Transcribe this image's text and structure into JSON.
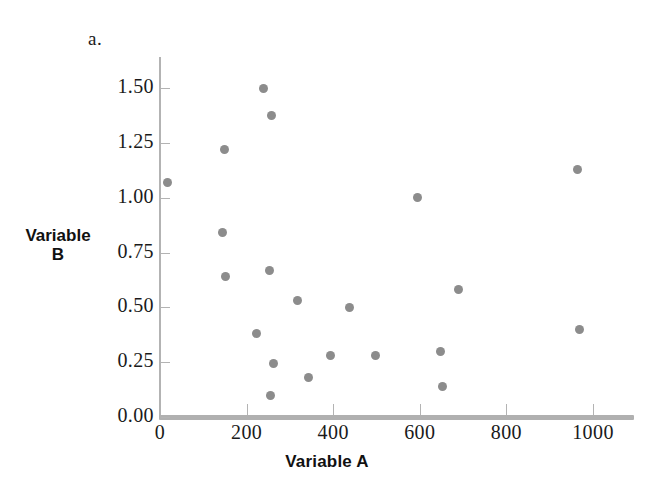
{
  "figure": {
    "panel_label": "a.",
    "marker_color": "#8c8c8c",
    "axis_color": "#b3b3b3",
    "background": "#ffffff"
  },
  "chart_data": {
    "type": "scatter",
    "title": "",
    "panel_label": "a.",
    "xlabel": "Variable A",
    "ylabel_lines": [
      "Variable",
      "B"
    ],
    "ylabel": "Variable B",
    "xlim": [
      0,
      1095
    ],
    "ylim": [
      0.0,
      1.575
    ],
    "xticks": [
      0,
      200,
      400,
      600,
      800,
      1000
    ],
    "xtick_labels": [
      "0",
      "200",
      "400",
      "600",
      "800",
      "1000"
    ],
    "yticks": [
      0.0,
      0.25,
      0.5,
      0.75,
      1.0,
      1.25,
      1.5
    ],
    "ytick_labels": [
      "0.00",
      "0.25",
      "0.50",
      "0.75",
      "1.00",
      "1.25",
      "1.50"
    ],
    "grid": false,
    "legend": false,
    "series": [
      {
        "name": "observations",
        "color": "#8c8c8c",
        "marker": "circle",
        "points": [
          {
            "x": 18,
            "y": 1.07
          },
          {
            "x": 150,
            "y": 1.22
          },
          {
            "x": 145,
            "y": 0.84
          },
          {
            "x": 152,
            "y": 0.64
          },
          {
            "x": 240,
            "y": 1.5
          },
          {
            "x": 257,
            "y": 1.375
          },
          {
            "x": 252,
            "y": 0.67
          },
          {
            "x": 222,
            "y": 0.38
          },
          {
            "x": 262,
            "y": 0.245
          },
          {
            "x": 255,
            "y": 0.1
          },
          {
            "x": 318,
            "y": 0.53
          },
          {
            "x": 343,
            "y": 0.18
          },
          {
            "x": 393,
            "y": 0.28
          },
          {
            "x": 437,
            "y": 0.5
          },
          {
            "x": 497,
            "y": 0.28
          },
          {
            "x": 595,
            "y": 1.0
          },
          {
            "x": 648,
            "y": 0.3
          },
          {
            "x": 652,
            "y": 0.14
          },
          {
            "x": 690,
            "y": 0.58
          },
          {
            "x": 965,
            "y": 1.13
          },
          {
            "x": 968,
            "y": 0.4
          }
        ]
      }
    ]
  }
}
